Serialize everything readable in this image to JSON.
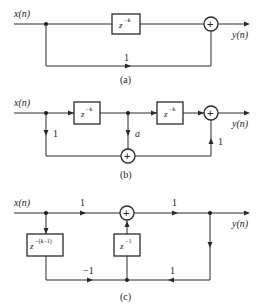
{
  "diagrams": [
    {
      "id": "a",
      "caption": "(a)",
      "input_label": "x(n)",
      "output_label": "y(n)",
      "delay_base": "z",
      "delay_exp": "−k",
      "feedforward_gain": "1",
      "sum_symbol": "+"
    },
    {
      "id": "b",
      "caption": "(b)",
      "input_label": "x(n)",
      "output_label": "y(n)",
      "delay1_base": "z",
      "delay1_exp": "−k",
      "delay2_base": "z",
      "delay2_exp": "−k",
      "gain_left": "1",
      "gain_mid": "a",
      "gain_right": "1",
      "sum_symbol": "+"
    },
    {
      "id": "c",
      "caption": "(c)",
      "input_label": "x(n)",
      "output_label": "y(n)",
      "delay_left_base": "z",
      "delay_left_exp": "−(k−1)",
      "delay_mid_base": "z",
      "delay_mid_exp": "−1",
      "gain_top_left": "1",
      "gain_top_right": "1",
      "gain_bottom_left": "−1",
      "gain_bottom_right": "1",
      "sum_symbol": "+"
    }
  ]
}
